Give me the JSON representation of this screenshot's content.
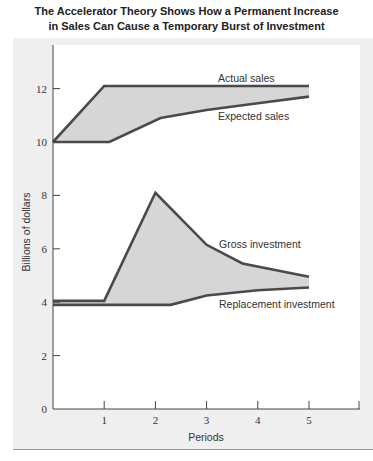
{
  "chart_data": {
    "type": "area",
    "title": "The Accelerator Theory Shows How a Permanent Increase in Sales Can Cause a Temporary Burst of Investment",
    "title_lines": [
      "The Accelerator Theory Shows How a Permanent Increase",
      "in Sales Can Cause a Temporary Burst of Investment"
    ],
    "xlabel": "Periods",
    "ylabel": "Billions of dollars",
    "xticks": [
      "1",
      "2",
      "3",
      "4",
      "5"
    ],
    "yticks": [
      "0",
      "2",
      "4",
      "6",
      "8",
      "10",
      "12"
    ],
    "xlim": [
      0,
      6
    ],
    "ylim": [
      0,
      13.5
    ],
    "grid": false,
    "series": [
      {
        "name": "Actual sales",
        "x": [
          0,
          1,
          5
        ],
        "values": [
          10,
          12.1,
          12.1
        ]
      },
      {
        "name": "Expected sales",
        "x": [
          0,
          1.1,
          2.1,
          3,
          4,
          5
        ],
        "values": [
          10,
          10,
          10.9,
          11.2,
          11.45,
          11.7
        ]
      },
      {
        "name": "Gross investment",
        "x": [
          0,
          1,
          2,
          3,
          3.7,
          5
        ],
        "values": [
          4.05,
          4.05,
          8.1,
          6.15,
          5.45,
          4.95
        ]
      },
      {
        "name": "Replacement investment",
        "x": [
          0,
          2.3,
          3,
          4,
          5
        ],
        "values": [
          3.9,
          3.9,
          4.25,
          4.45,
          4.55
        ]
      }
    ],
    "annotations": [
      "Actual sales",
      "Expected sales",
      "Gross investment",
      "Replacement investment"
    ]
  }
}
